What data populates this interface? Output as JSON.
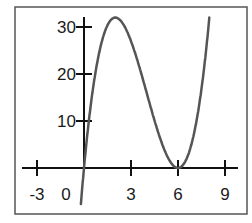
{
  "chart_data": {
    "type": "line",
    "title": "",
    "xlabel": "",
    "ylabel": "",
    "function": "y = x(x - 6)^2",
    "xlim": [
      -4.5,
      10.5
    ],
    "ylim": [
      -7,
      32
    ],
    "grid": false,
    "legend": null,
    "x_ticks": [
      -3,
      0,
      3,
      6,
      9
    ],
    "x_tick_labels": [
      "-3",
      "0",
      "3",
      "6",
      "9"
    ],
    "y_ticks": [
      10,
      20,
      30
    ],
    "y_tick_labels": [
      "10",
      "20",
      "30"
    ],
    "series": [
      {
        "name": "f(x)",
        "color": "#555555",
        "x": [
          -0.2,
          0,
          0.5,
          1,
          1.5,
          2,
          2.5,
          3,
          3.5,
          4,
          4.5,
          5,
          5.5,
          6,
          6.5,
          7,
          7.5,
          8,
          8.3
        ],
        "y": [
          -7.7,
          0,
          15.1,
          25,
          30.4,
          32,
          30.6,
          27,
          21.9,
          16,
          10.1,
          5,
          1.4,
          0,
          1.6,
          7,
          16.9,
          32,
          43.9
        ]
      }
    ],
    "annotations": []
  },
  "labels": {
    "x": [
      "-3",
      "0",
      "3",
      "6",
      "9"
    ],
    "y": [
      "10",
      "20",
      "30"
    ]
  }
}
